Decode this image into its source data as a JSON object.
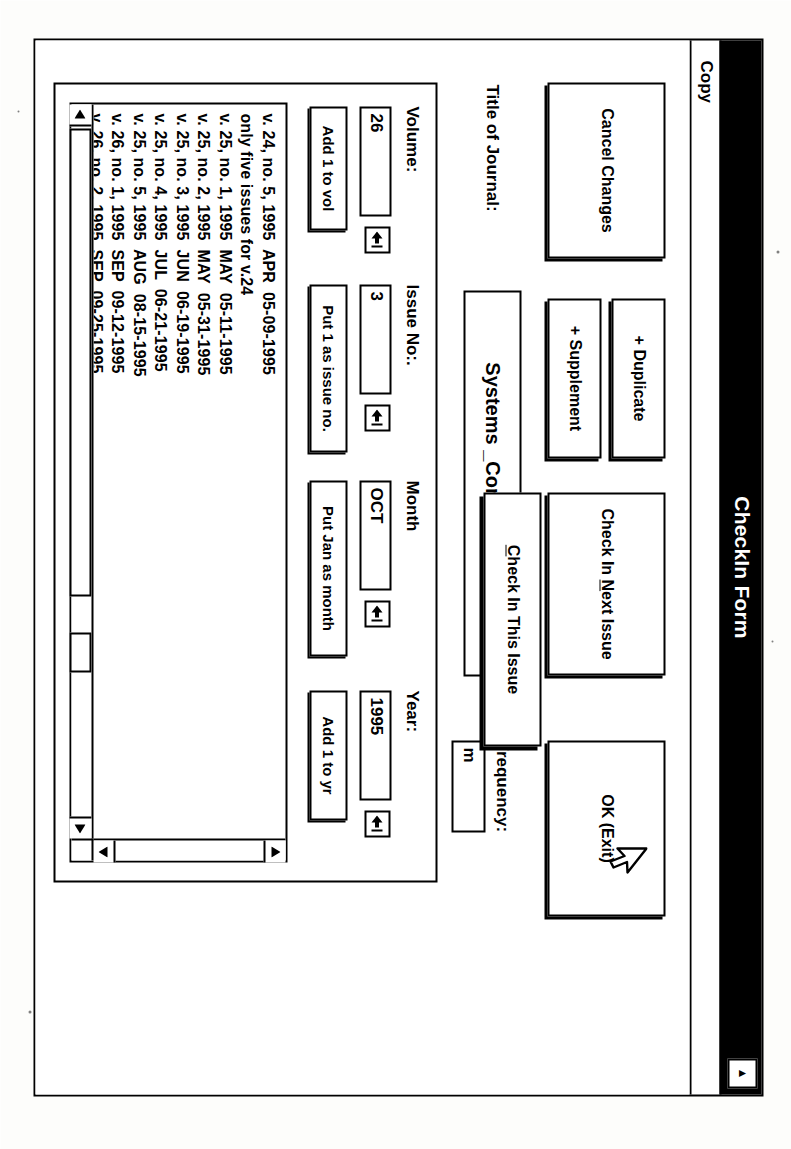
{
  "window": {
    "title": "CheckIn Form",
    "minimize_glyph": "▲"
  },
  "menubar": {
    "items": [
      {
        "label": "Copy"
      }
    ]
  },
  "buttons": {
    "cancel_changes": "Cancel Changes",
    "duplicate": "+ Duplicate",
    "supplement": "+ Supplement",
    "check_in_next_issue_pre": "Check In ",
    "check_in_next_issue_key": "N",
    "check_in_next_issue_post": "ext Issue",
    "ok_exit": "OK (Exit)",
    "add_1_to_vol": "Add 1 to vol",
    "put_1_as_issue_no": "Put 1 as issue no.",
    "put_jan_as_month": "Put Jan as month",
    "add_1_to_yr": "Add 1 to yr",
    "check_in_this_issue_key": "C",
    "check_in_this_issue_post": "heck In This Issue"
  },
  "journal": {
    "label": "Title of Journal:",
    "value": "Systems _Control Letters"
  },
  "frequency": {
    "label": "Frequency:",
    "value": "m"
  },
  "fields": {
    "volume": {
      "label": "Volume:",
      "value": "26"
    },
    "issue_no": {
      "label": "Issue No:.",
      "value": "3"
    },
    "month": {
      "label": "Month",
      "value": "OCT"
    },
    "year": {
      "label": "Year:",
      "value": "1995"
    }
  },
  "issue_list": {
    "rows": [
      {
        "volume": "v. 24,",
        "issue": "no. 5,",
        "year": "1995",
        "month": "APR",
        "date": "05-09-1995"
      },
      {
        "note": "only five issues for v.24"
      },
      {
        "volume": "v. 25,",
        "issue": "no. 1,",
        "year": "1995",
        "month": "MAY",
        "date": "05-11-1995"
      },
      {
        "volume": "v. 25,",
        "issue": "no. 2,",
        "year": "1995",
        "month": "MAY",
        "date": "05-31-1995"
      },
      {
        "volume": "v. 25,",
        "issue": "no. 3,",
        "year": "1995",
        "month": "JUN",
        "date": "06-19-1995"
      },
      {
        "volume": "v. 25,",
        "issue": "no. 4,",
        "year": "1995",
        "month": "JUL",
        "date": "06-21-1995"
      },
      {
        "volume": "v. 25,",
        "issue": "no. 5,",
        "year": "1995",
        "month": "AUG",
        "date": "08-15-1995"
      },
      {
        "volume": "v. 26,",
        "issue": "no. 1,",
        "year": "1995",
        "month": "SEP",
        "date": "09-12-1995"
      },
      {
        "volume": "v. 26,",
        "issue": "no. 2,",
        "year": "1995",
        "month": "SEP",
        "date": "09-25-1995"
      },
      {
        "volume": "v. 26,",
        "issue": "no. 3,",
        "year": "1995",
        "month": "OCT",
        "date": "10-23-1995"
      }
    ],
    "caret": "_"
  },
  "icons": {
    "spin_lookup": "spin-arrow-icon",
    "scroll_up": "▲",
    "scroll_down": "▼",
    "scroll_left": "◄",
    "scroll_right": "►",
    "cursor": "mouse-pointer-icon"
  },
  "colors": {
    "titlebar_bg": "#000000",
    "titlebar_fg": "#ffffff",
    "window_bg": "#ffffff",
    "border": "#000000"
  }
}
